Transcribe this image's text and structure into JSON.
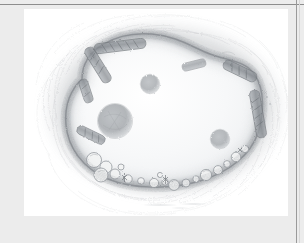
{
  "document": {
    "title": "Pencil illustration of a cell",
    "background_color": "#ececec",
    "panel_color": "#ffffff",
    "rule_color": "#8d8d8d"
  },
  "figure": {
    "name": "cell-diagram",
    "medium": "graphite pencil drawing",
    "alt_text": "Graphite pencil drawing of a rounded kidney-bean shaped cell. A shaded cytoplasmic rim runs around the outline, studded with elongated rod-shaped organelles at the upper left and right and with clustered round vesicles along the lower border. Three soft grey blobs float in the pale interior. A hazy pencil halo radiates outward from the cell boundary.",
    "caption": "",
    "outline_color": "#8a8d91",
    "rim_color": "#9ea2a6",
    "interior_color": "#f3f4f5",
    "blob_color": "#a8acb0",
    "halo_color": "#c9cbcd",
    "parts": [
      {
        "name": "cell-outline",
        "label": "cell boundary"
      },
      {
        "name": "cytoplasm-rim",
        "label": "shaded cortical rim"
      },
      {
        "name": "rod-organelles",
        "label": "rod-shaped organelles",
        "count": 7
      },
      {
        "name": "vesicle-cluster",
        "label": "round vesicles along lower rim",
        "count": 18
      },
      {
        "name": "interior-blobs",
        "label": "interior grey bodies",
        "count": 3
      },
      {
        "name": "pencil-halo",
        "label": "hatched pencil halo"
      }
    ],
    "interior_blobs": [
      {
        "name": "blob-left",
        "cx": 91,
        "cy": 112,
        "r": 17
      },
      {
        "name": "blob-top",
        "cx": 126,
        "cy": 75,
        "r": 9.5
      },
      {
        "name": "blob-right",
        "cx": 196,
        "cy": 130,
        "r": 9.5
      }
    ]
  }
}
